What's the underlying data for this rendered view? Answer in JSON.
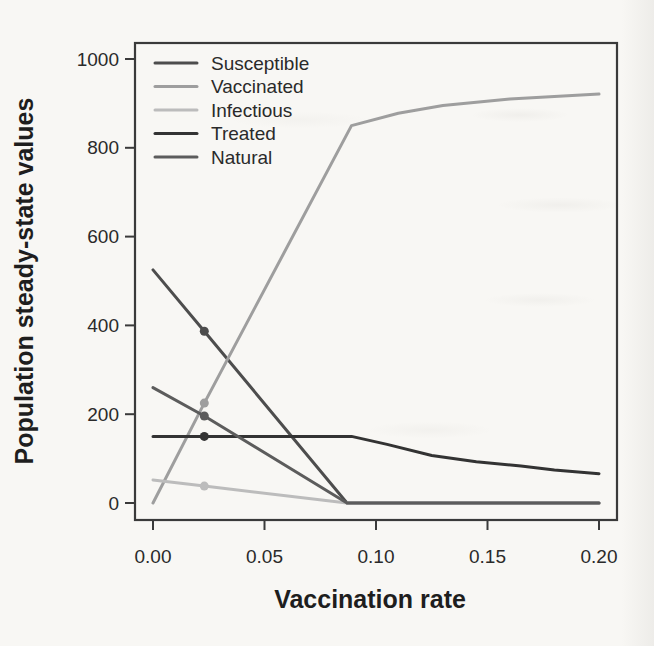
{
  "figure": {
    "background_color": "#f8f7f4",
    "axis_color": "#3a3a3a",
    "text_color": "#2a2a2a"
  },
  "chart_data": {
    "type": "line",
    "title": "",
    "xlabel": "Vaccination rate",
    "ylabel": "Population steady-state values",
    "xlim": [
      0,
      0.2
    ],
    "ylim": [
      0,
      1000
    ],
    "grid": false,
    "x_tick_values": [
      0,
      0.05,
      0.1,
      0.15,
      0.2
    ],
    "x_tick_labels": [
      "0.00",
      "0.05",
      "0.10",
      "0.15",
      "0.20"
    ],
    "y_tick_values": [
      0,
      200,
      400,
      600,
      800,
      1000
    ],
    "y_tick_labels": [
      "0",
      "200",
      "400",
      "600",
      "800",
      "1000"
    ],
    "legend": {
      "position": "top-left",
      "entries": [
        "Susceptible",
        "Vaccinated",
        "Infectious",
        "Treated",
        "Natural"
      ]
    },
    "critical_vaccination_rate": 0.088,
    "series": [
      {
        "name": "Susceptible",
        "color": "#4d4d4d",
        "points": [
          [
            0,
            525
          ],
          [
            0.023,
            387
          ],
          [
            0.087,
            0
          ],
          [
            0.2,
            0
          ]
        ]
      },
      {
        "name": "Vaccinated",
        "color": "#9e9e9e",
        "points": [
          [
            0,
            0
          ],
          [
            0.023,
            225
          ],
          [
            0.089,
            850
          ],
          [
            0.11,
            878
          ],
          [
            0.13,
            895
          ],
          [
            0.16,
            910
          ],
          [
            0.2,
            921
          ]
        ]
      },
      {
        "name": "Infectious",
        "color": "#bcbcbc",
        "points": [
          [
            0,
            52
          ],
          [
            0.023,
            38
          ],
          [
            0.087,
            0
          ],
          [
            0.2,
            0
          ]
        ]
      },
      {
        "name": "Treated",
        "color": "#333333",
        "points": [
          [
            0,
            150
          ],
          [
            0.089,
            150
          ],
          [
            0.105,
            132
          ],
          [
            0.125,
            107
          ],
          [
            0.145,
            93
          ],
          [
            0.165,
            83
          ],
          [
            0.18,
            74
          ],
          [
            0.2,
            66
          ]
        ]
      },
      {
        "name": "Natural",
        "color": "#5c5c5c",
        "points": [
          [
            0,
            260
          ],
          [
            0.023,
            196
          ],
          [
            0.087,
            0
          ],
          [
            0.2,
            0
          ]
        ]
      }
    ],
    "markers": [
      {
        "series": "Susceptible",
        "x": 0.023,
        "y": 387
      },
      {
        "series": "Vaccinated",
        "x": 0.023,
        "y": 225
      },
      {
        "series": "Infectious",
        "x": 0.023,
        "y": 38
      },
      {
        "series": "Treated",
        "x": 0.023,
        "y": 150
      },
      {
        "series": "Natural",
        "x": 0.023,
        "y": 196
      }
    ]
  }
}
